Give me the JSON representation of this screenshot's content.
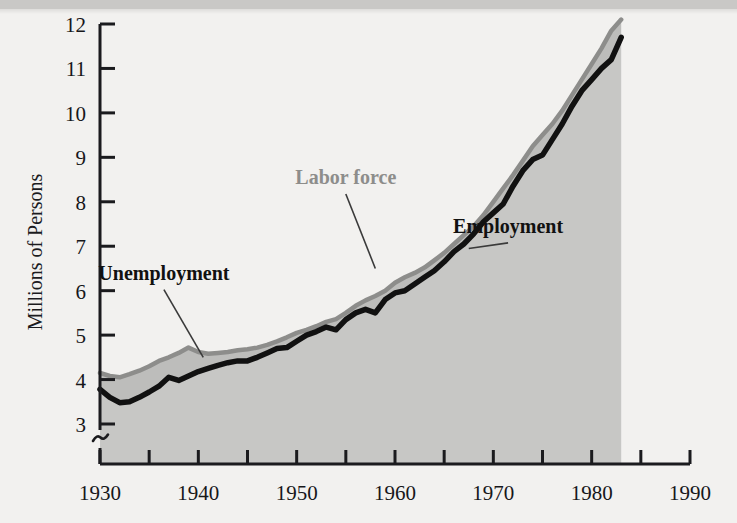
{
  "figure": {
    "background_color": "#f2f1ef",
    "plot_fill_color": "#c7c7c5",
    "labor_force_color": "#8d8d8b",
    "employment_color": "#111111",
    "axis_color": "#1b1b1e"
  },
  "chart_data": {
    "type": "area",
    "title": "",
    "xlabel": "",
    "ylabel": "Millions of Persons",
    "xlim": [
      1928,
      1990
    ],
    "ylim": [
      2.55,
      12.0
    ],
    "y_axis_break": true,
    "y_axis_break_symbol": "~",
    "grid": false,
    "legend_position": "inline-annotations",
    "xticks": [
      1930,
      1935,
      1940,
      1945,
      1950,
      1955,
      1960,
      1965,
      1970,
      1975,
      1980,
      1985,
      1990
    ],
    "xtick_labels": [
      "1930",
      "",
      "1940",
      "",
      "1950",
      "",
      "1960",
      "",
      "1970",
      "",
      "1980",
      "",
      "1990"
    ],
    "yticks": [
      3,
      4,
      5,
      6,
      7,
      8,
      9,
      10,
      11,
      12
    ],
    "ytick_labels": [
      "3",
      "4",
      "5",
      "6",
      "7",
      "8",
      "9",
      "10",
      "11",
      "12"
    ],
    "x": [
      1930,
      1931,
      1932,
      1933,
      1934,
      1935,
      1936,
      1937,
      1938,
      1939,
      1940,
      1941,
      1942,
      1943,
      1944,
      1945,
      1946,
      1947,
      1948,
      1949,
      1950,
      1951,
      1952,
      1953,
      1954,
      1955,
      1956,
      1957,
      1958,
      1959,
      1960,
      1961,
      1962,
      1963,
      1964,
      1965,
      1966,
      1967,
      1968,
      1969,
      1970,
      1971,
      1972,
      1973,
      1974,
      1975,
      1976,
      1977,
      1978,
      1979,
      1980,
      1981,
      1982,
      1983
    ],
    "series": [
      {
        "name": "Labor force",
        "color": "#8d8d8b",
        "values": [
          4.15,
          4.08,
          4.05,
          4.12,
          4.2,
          4.3,
          4.42,
          4.5,
          4.6,
          4.72,
          4.62,
          4.58,
          4.6,
          4.62,
          4.66,
          4.68,
          4.72,
          4.78,
          4.86,
          4.95,
          5.05,
          5.12,
          5.2,
          5.3,
          5.36,
          5.5,
          5.66,
          5.78,
          5.88,
          6.0,
          6.18,
          6.3,
          6.4,
          6.52,
          6.68,
          6.85,
          7.05,
          7.25,
          7.45,
          7.7,
          8.0,
          8.3,
          8.6,
          8.92,
          9.25,
          9.5,
          9.75,
          10.05,
          10.4,
          10.75,
          11.1,
          11.45,
          11.85,
          12.1
        ]
      },
      {
        "name": "Employment",
        "color": "#111111",
        "values": [
          3.78,
          3.6,
          3.48,
          3.5,
          3.6,
          3.72,
          3.85,
          4.05,
          3.98,
          4.08,
          4.18,
          4.25,
          4.32,
          4.38,
          4.42,
          4.42,
          4.5,
          4.6,
          4.7,
          4.72,
          4.86,
          5.0,
          5.08,
          5.18,
          5.12,
          5.35,
          5.5,
          5.58,
          5.5,
          5.8,
          5.95,
          6.0,
          6.15,
          6.3,
          6.45,
          6.65,
          6.88,
          7.05,
          7.28,
          7.55,
          7.75,
          7.95,
          8.35,
          8.7,
          8.95,
          9.05,
          9.4,
          9.75,
          10.15,
          10.5,
          10.75,
          11.0,
          11.2,
          11.7
        ]
      }
    ],
    "annotations": [
      {
        "label": "Labor force",
        "color": "#8d8d8b",
        "x": 1955.0,
        "y": 8.4,
        "leader_to_x": 1958.0,
        "leader_to_y": 6.5
      },
      {
        "label": "Unemployment",
        "color": "#111111",
        "x": 1936.5,
        "y": 6.25,
        "leader_to_x": 1940.5,
        "leader_to_y": 4.5
      },
      {
        "label": "Employment",
        "color": "#111111",
        "x": 1971.5,
        "y": 7.3,
        "leader_to_x": 1967.5,
        "leader_to_y": 6.95
      }
    ]
  }
}
